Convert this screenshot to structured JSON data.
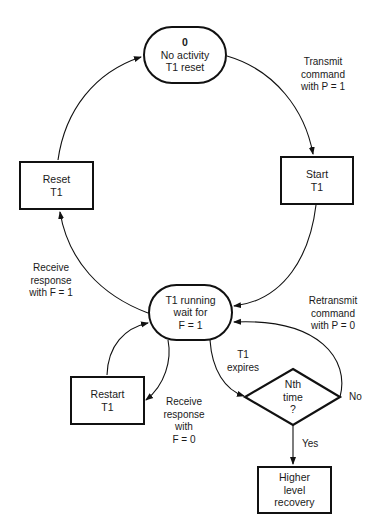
{
  "nodes": {
    "idle": {
      "lines": [
        "0",
        "No activity",
        "T1 reset"
      ]
    },
    "start_t1": {
      "lines": [
        "Start",
        "T1"
      ]
    },
    "reset_t1": {
      "lines": [
        "Reset",
        "T1"
      ]
    },
    "running": {
      "lines": [
        "T1 running",
        "wait for",
        "F = 1"
      ]
    },
    "restart_t1": {
      "lines": [
        "Restart",
        "T1"
      ]
    },
    "nth_time": {
      "lines": [
        "Nth",
        "time",
        "?"
      ]
    },
    "recovery": {
      "lines": [
        "Higher",
        "level",
        "recovery"
      ]
    }
  },
  "edges": {
    "transmit": {
      "lines": [
        "Transmit",
        "command",
        "with P = 1"
      ]
    },
    "receive_f1": {
      "lines": [
        "Receive",
        "response",
        "with F = 1"
      ]
    },
    "retransmit": {
      "lines": [
        "Retransmit",
        "command",
        "with P = 0"
      ]
    },
    "t1_expires": {
      "lines": [
        "T1",
        "expires"
      ]
    },
    "receive_f0": {
      "lines": [
        "Receive",
        "response",
        "with",
        "F = 0"
      ]
    },
    "no": {
      "label": "No"
    },
    "yes": {
      "label": "Yes"
    }
  },
  "colors": {
    "stroke": "#111111",
    "background": "#ffffff"
  }
}
